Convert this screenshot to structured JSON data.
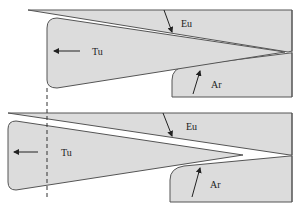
{
  "figure": {
    "panels": [
      {
        "id": "top",
        "labels": {
          "eurasia": "Eu",
          "turkey": "Tu",
          "arabia": "Ar"
        }
      },
      {
        "id": "bottom",
        "labels": {
          "eurasia": "Eu",
          "turkey": "Tu",
          "arabia": "Ar"
        }
      }
    ],
    "colors": {
      "plate_fill": "#dcdcdc",
      "outline": "#555555",
      "text": "#222222",
      "background": "#ffffff"
    }
  }
}
